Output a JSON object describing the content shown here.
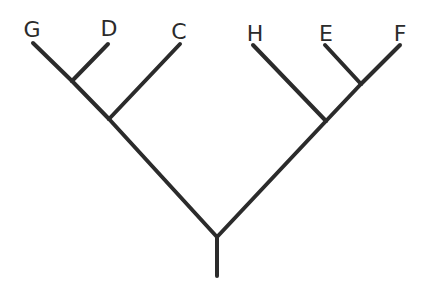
{
  "diagram": {
    "type": "cladogram",
    "line_color": "#2b2b2b",
    "leaves": [
      {
        "id": "G",
        "label": "G",
        "tip": [
          33,
          43
        ],
        "label_pos": [
          32,
          37
        ]
      },
      {
        "id": "D",
        "label": "D",
        "tip": [
          108,
          44
        ],
        "label_pos": [
          109,
          36
        ]
      },
      {
        "id": "C",
        "label": "C",
        "tip": [
          180,
          44
        ],
        "label_pos": [
          179,
          39
        ]
      },
      {
        "id": "H",
        "label": "H",
        "tip": [
          253,
          45
        ],
        "label_pos": [
          255,
          41
        ]
      },
      {
        "id": "E",
        "label": "E",
        "tip": [
          325,
          45
        ],
        "label_pos": [
          326,
          41
        ]
      },
      {
        "id": "F",
        "label": "F",
        "tip": [
          400,
          45
        ],
        "label_pos": [
          400,
          41
        ]
      }
    ],
    "internal_nodes": [
      {
        "id": "GD",
        "pos": [
          72,
          81
        ],
        "children": [
          "G",
          "D"
        ]
      },
      {
        "id": "GDC",
        "pos": [
          109,
          119
        ],
        "children": [
          "GD",
          "C"
        ]
      },
      {
        "id": "EF",
        "pos": [
          361,
          84
        ],
        "children": [
          "E",
          "F"
        ]
      },
      {
        "id": "HEF",
        "pos": [
          326,
          121
        ],
        "children": [
          "H",
          "EF"
        ]
      },
      {
        "id": "root",
        "pos": [
          217,
          237
        ],
        "children": [
          "GDC",
          "HEF"
        ]
      }
    ],
    "root_stem": {
      "from": [
        217,
        237
      ],
      "to": [
        217,
        276
      ]
    },
    "topology": "((((G,D),C),(H,(E,F))))"
  }
}
